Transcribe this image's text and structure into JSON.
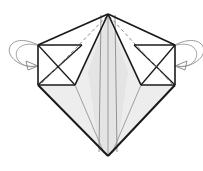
{
  "figure": {
    "type": "origami-fold-diagram",
    "canvas": {
      "width": 203,
      "height": 171
    },
    "background_color": "#ffffff"
  },
  "colors": {
    "outline": "#1a1a1a",
    "crease_line": "#5a5a5a",
    "dashed_crease": "#8c8c8c",
    "arrow": "#9a9a9a",
    "fill_white": "#ffffff",
    "fill_light": "#f2f2f2",
    "fill_gray": "#e4e4e4",
    "fill_gray_dark": "#dcdcdc"
  },
  "vertices": {
    "apex_top": {
      "x": 108,
      "y": 14
    },
    "apex_bottom": {
      "x": 108,
      "y": 156
    },
    "left_upper": {
      "x": 38,
      "y": 45
    },
    "left_lower": {
      "x": 38,
      "y": 85
    },
    "right_upper": {
      "x": 175,
      "y": 45
    },
    "right_lower": {
      "x": 175,
      "y": 85
    },
    "left_box_inner_top": {
      "x": 82,
      "y": 45
    },
    "left_box_inner_bottom": {
      "x": 75,
      "y": 85
    },
    "right_box_inner_top": {
      "x": 134,
      "y": 45
    },
    "right_box_inner_bottom": {
      "x": 141,
      "y": 85
    },
    "center_left_spine": {
      "x": 101,
      "y": 14
    },
    "center_right_spine": {
      "x": 115,
      "y": 14
    }
  },
  "panels": [
    {
      "name": "left-upper-white-wing",
      "fill": "#ffffff"
    },
    {
      "name": "right-upper-white-wing",
      "fill": "#ffffff"
    },
    {
      "name": "left-inner-box",
      "fill": "#ffffff"
    },
    {
      "name": "right-inner-box",
      "fill": "#ffffff"
    },
    {
      "name": "center-left-panel",
      "fill": "#e4e4e4"
    },
    {
      "name": "center-right-panel",
      "fill": "#e4e4e4"
    },
    {
      "name": "lower-left-panel",
      "fill": "#ededed"
    },
    {
      "name": "lower-right-panel",
      "fill": "#ededed"
    }
  ],
  "creases": {
    "dashed_left_label": "valley fold apex to left box corner",
    "dashed_right_label": "valley fold apex to right box corner",
    "center_spine_label": "center vertical crease"
  },
  "arrows": [
    {
      "name": "left-fold-arrow",
      "direction": "inward-down",
      "style": "curved-loop",
      "color": "#9a9a9a"
    },
    {
      "name": "right-fold-arrow",
      "direction": "inward-down",
      "style": "curved-loop",
      "color": "#9a9a9a"
    }
  ],
  "labels": {
    "caption": ""
  }
}
